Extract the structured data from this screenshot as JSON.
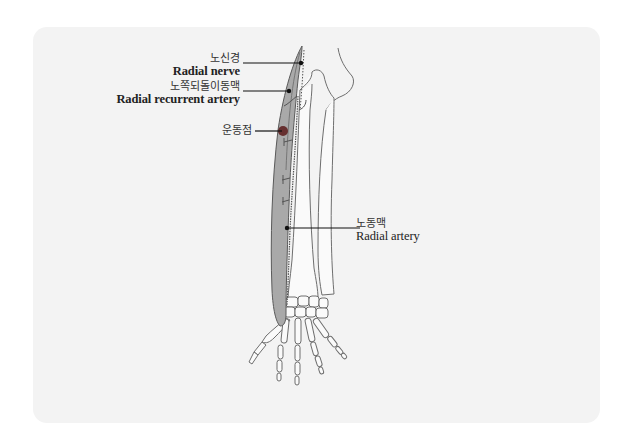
{
  "diagram": {
    "labels": [
      {
        "id": "radial-nerve",
        "korean": "노신경",
        "english": "Radial nerve"
      },
      {
        "id": "radial-recurrent-artery",
        "korean": "노쪽되돌이동맥",
        "english": "Radial recurrent artery"
      },
      {
        "id": "motor-point",
        "korean": "운동점",
        "english": ""
      },
      {
        "id": "radial-artery",
        "korean": "노동맥",
        "english": "Radial artery"
      }
    ],
    "colors": {
      "panel_bg": "#f3f3f3",
      "muscle_fill": "#a9a9a9",
      "muscle_outline": "#5a5a5a",
      "bone_outline": "#6e6e6e",
      "leader_line": "#111111",
      "motor_point": "#5a1a1a"
    }
  }
}
